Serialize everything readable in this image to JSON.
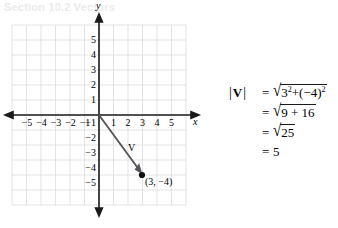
{
  "ghost": {
    "text": "Section 10.2 Vectors"
  },
  "figure": {
    "axis_labels": {
      "x": "x",
      "y": "y"
    },
    "x_ticks": [
      "-5",
      "-4",
      "-3",
      "-2",
      "-1",
      "1",
      "2",
      "3",
      "4",
      "5"
    ],
    "y_ticks_positive": [
      "1",
      "2",
      "3",
      "4",
      "5"
    ],
    "y_ticks_negative": [
      "-1",
      "-2",
      "-3",
      "-4",
      "-5"
    ],
    "vector": {
      "label": "V",
      "start": [
        0,
        0
      ],
      "end": [
        3,
        -4
      ],
      "point_label": "(3, -4)"
    },
    "grid": {
      "x_range": [
        -6,
        6
      ],
      "y_range": [
        -6,
        6
      ],
      "visible": true
    },
    "colors": {
      "axis": "#1a1a1a",
      "grid": "#d9d9d9",
      "vector": "#4a4a52",
      "text": "#1a1a1a"
    }
  },
  "equations": [
    {
      "lhs_bar_open": "|",
      "lhs_symbol": "V",
      "lhs_bar_close": "|",
      "equals": "=",
      "radicand": "3",
      "exponent": "2",
      "plus": "+",
      "second_term": "(-4)",
      "second_exponent": "2",
      "full_text": "|V| = √(3² + (-4)²)"
    },
    {
      "equals": "=",
      "radicand": "9 + 16",
      "full_text": "= √(9 + 16)"
    },
    {
      "equals": "=",
      "radicand": "25",
      "full_text": "= √25"
    },
    {
      "equals": "=",
      "value": "5",
      "full_text": "= 5"
    }
  ]
}
